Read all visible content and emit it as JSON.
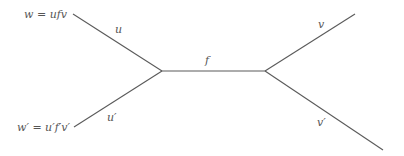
{
  "diagram": {
    "type": "graph",
    "nodes": [
      {
        "id": "w",
        "label": "w = ufv"
      },
      {
        "id": "w_prime",
        "label": "w′ = u′f′v′"
      },
      {
        "id": "junction_left",
        "label": ""
      },
      {
        "id": "junction_right",
        "label": ""
      },
      {
        "id": "end_v",
        "label": ""
      },
      {
        "id": "end_v_prime",
        "label": ""
      }
    ],
    "edges": [
      {
        "id": "u",
        "label": "u",
        "from": "w",
        "to": "junction_left"
      },
      {
        "id": "u_prime",
        "label": "u′",
        "from": "w_prime",
        "to": "junction_left"
      },
      {
        "id": "f",
        "label": "f",
        "from": "junction_left",
        "to": "junction_right"
      },
      {
        "id": "v",
        "label": "v",
        "from": "junction_right",
        "to": "end_v"
      },
      {
        "id": "v_prime",
        "label": "v′",
        "from": "junction_right",
        "to": "end_v_prime"
      }
    ]
  }
}
